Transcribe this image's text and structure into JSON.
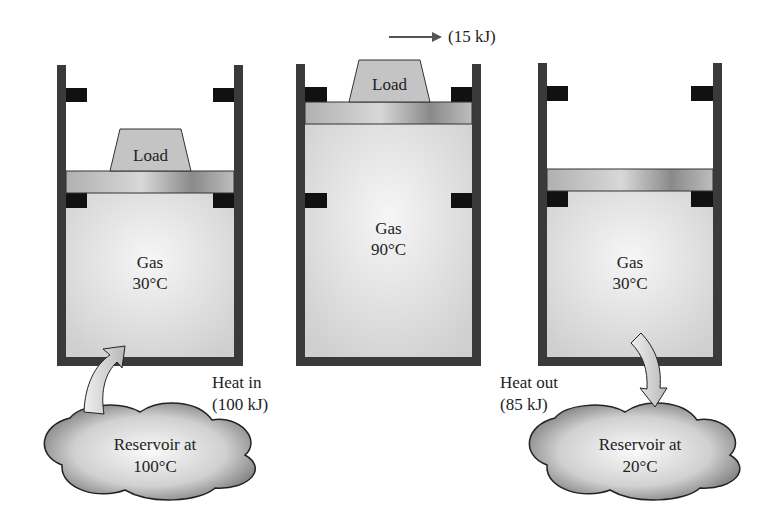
{
  "work": {
    "label": "(15 kJ)"
  },
  "cylinders": [
    {
      "load": "Load",
      "gas": "Gas",
      "temp": "30°C"
    },
    {
      "load": "Load",
      "gas": "Gas",
      "temp": "90°C"
    },
    {
      "gas": "Gas",
      "temp": "30°C"
    }
  ],
  "heat_in": {
    "line1": "Heat in",
    "line2": "(100 kJ)"
  },
  "heat_out": {
    "line1": "Heat out",
    "line2": "(85 kJ)"
  },
  "reservoirs": [
    {
      "line1": "Reservoir at",
      "line2": "100°C"
    },
    {
      "line1": "Reservoir at",
      "line2": "20°C"
    }
  ],
  "colors": {
    "wall": "#3a3a3a",
    "stop": "#111111",
    "piston": "#a8a8a8",
    "gas": "#e6e6e6",
    "load": "#c4c4c4"
  }
}
